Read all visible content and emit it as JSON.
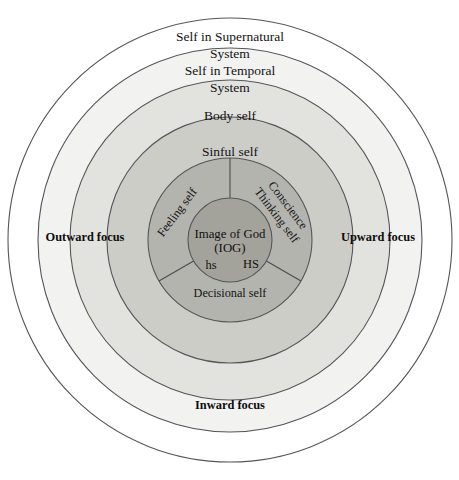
{
  "diagram": {
    "background_color": "#ffffff",
    "stroke_color": "#55565a",
    "center": {
      "x": 230,
      "y": 240
    },
    "rings": [
      {
        "id": "supernatural",
        "label_line1": "Self in Supernatural",
        "label_line2": "System",
        "radius": 222,
        "fill": "#ffffff",
        "focus": "outer"
      },
      {
        "id": "temporal",
        "label_line1": "Self in Temporal",
        "label_line2": "System",
        "radius": 192,
        "fill": "#f2f2f0"
      },
      {
        "id": "body",
        "label_line1": "Body self",
        "label_line2": "",
        "radius": 160,
        "fill": "#e2e2de"
      },
      {
        "id": "sinful",
        "label_line1": "Sinful self",
        "label_line2": "",
        "radius": 123,
        "fill": "#cdcdc8"
      },
      {
        "id": "tripartite",
        "label_line1": "",
        "label_line2": "",
        "radius": 82,
        "fill": "#b4b4ae"
      },
      {
        "id": "core",
        "label_line1": "",
        "label_line2": "",
        "radius": 42,
        "fill": "#a3a39c"
      }
    ],
    "sectors": [
      {
        "id": "feeling",
        "label": "Feeling self",
        "rotation": -53,
        "x": 178,
        "y": 213
      },
      {
        "id": "conscience-thinking",
        "label_line1": "Conscience",
        "label_line2": "Thinking self",
        "rotation": 53,
        "x": 283,
        "y": 211
      },
      {
        "id": "decisional",
        "label": "Decisional self",
        "x": 230,
        "y": 293
      }
    ],
    "core": {
      "line1": "Image of God",
      "line2": "(IOG)",
      "abbr_left": "hs",
      "abbr_right": "HS"
    },
    "focus_labels": [
      {
        "id": "outward",
        "text": "Outward focus",
        "x": 85,
        "y": 238
      },
      {
        "id": "upward",
        "text": "Upward focus",
        "x": 378,
        "y": 238
      },
      {
        "id": "inward",
        "text": "Inward focus",
        "x": 230,
        "y": 406
      }
    ]
  }
}
